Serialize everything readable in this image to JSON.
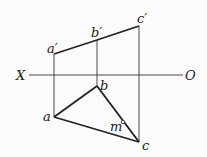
{
  "diagram": {
    "type": "orthographic-projection",
    "axis": {
      "left_label": "X",
      "right_label": "O"
    },
    "points": {
      "front": [
        {
          "id": "a_prime",
          "label": "a′"
        },
        {
          "id": "b_prime",
          "label": "b′"
        },
        {
          "id": "c_prime",
          "label": "c′"
        }
      ],
      "top": [
        {
          "id": "a",
          "label": "a"
        },
        {
          "id": "b",
          "label": "b"
        },
        {
          "id": "c",
          "label": "c"
        },
        {
          "id": "m",
          "label": "m"
        }
      ]
    },
    "edges": {
      "front_view": [
        [
          "a_prime",
          "b_prime"
        ],
        [
          "b_prime",
          "c_prime"
        ]
      ],
      "top_view": [
        [
          "a",
          "b"
        ],
        [
          "b",
          "c"
        ],
        [
          "c",
          "a"
        ]
      ],
      "projection_lines": [
        [
          "a_prime",
          "a"
        ],
        [
          "b_prime",
          "b"
        ],
        [
          "c_prime",
          "c"
        ]
      ]
    }
  }
}
